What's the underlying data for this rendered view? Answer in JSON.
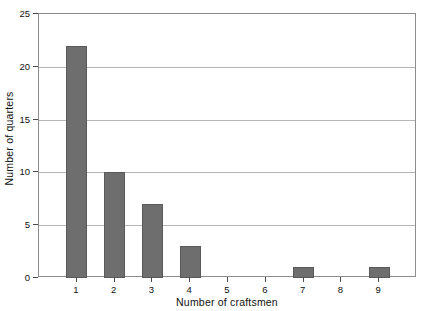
{
  "chart_data": {
    "type": "bar",
    "title": "",
    "xlabel": "Number of craftsmen",
    "ylabel": "Number of quarters",
    "categories": [
      "1",
      "2",
      "3",
      "4",
      "5",
      "6",
      "7",
      "8",
      "9"
    ],
    "values": [
      22,
      10,
      7,
      3,
      0,
      0,
      1,
      0,
      1
    ],
    "ylim": [
      0,
      25
    ],
    "yticks": [
      "0",
      "5",
      "10",
      "15",
      "20",
      "25"
    ],
    "ytick_values": [
      0,
      5,
      10,
      15,
      20,
      25
    ],
    "xticks": [
      "1",
      "2",
      "3",
      "4",
      "5",
      "6",
      "7",
      "8",
      "9"
    ],
    "grid": true,
    "grid_axis": "y",
    "legend": false,
    "legend_position": "none",
    "bar_color": "#6e6e6e",
    "bar_edge_color": "#5a5a5a",
    "grid_color": "#b5b5b5",
    "frame_color": "#8c8c8c",
    "background": "#ffffff"
  }
}
